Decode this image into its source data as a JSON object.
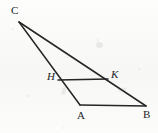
{
  "figure": {
    "background_color": "#fbfbfa",
    "stroke_color": "#262626",
    "label_color": "#1d1d1d",
    "width": 158,
    "height": 133,
    "points": [
      {
        "name": "C",
        "label": "C",
        "x": 19,
        "y": 22,
        "label_x": 11,
        "label_y": 5,
        "italic": false
      },
      {
        "name": "A",
        "label": "A",
        "x": 80,
        "y": 105,
        "label_x": 77,
        "label_y": 110,
        "italic": false
      },
      {
        "name": "B",
        "label": "B",
        "x": 146,
        "y": 106,
        "label_x": 143,
        "label_y": 109,
        "italic": false
      },
      {
        "name": "H",
        "label": "H",
        "x": 58,
        "y": 80,
        "label_x": 47,
        "label_y": 71,
        "italic": true
      },
      {
        "name": "K",
        "label": "K",
        "x": 108,
        "y": 79,
        "label_x": 111,
        "label_y": 69,
        "italic": true
      }
    ],
    "segments": [
      {
        "name": "segment-CA",
        "from": "C",
        "to": "A",
        "x1": 19,
        "y1": 22,
        "x2": 80,
        "y2": 105,
        "width": 1.5
      },
      {
        "name": "segment-CB",
        "from": "C",
        "to": "B",
        "x1": 19,
        "y1": 22,
        "x2": 146,
        "y2": 106,
        "width": 1.5
      },
      {
        "name": "segment-AB",
        "from": "A",
        "to": "B",
        "x1": 80,
        "y1": 105,
        "x2": 146,
        "y2": 106,
        "width": 1.5
      },
      {
        "name": "segment-HK",
        "from": "H",
        "to": "K",
        "x1": 58,
        "y1": 80,
        "x2": 108,
        "y2": 79,
        "width": 1.5
      }
    ]
  }
}
